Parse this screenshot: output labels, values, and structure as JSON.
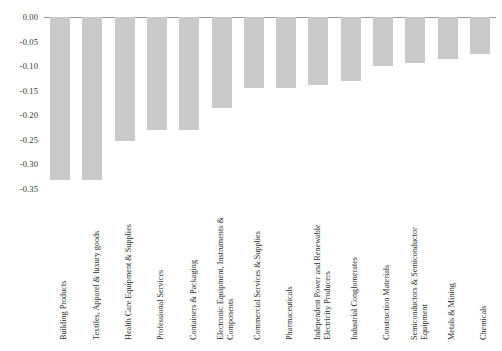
{
  "chart_data": {
    "type": "bar",
    "title": "",
    "subtitle": "",
    "xlabel": "",
    "ylabel": "",
    "ylim": [
      -0.35,
      0.0
    ],
    "grid": false,
    "legend": null,
    "bar_color": "#c9c9c9",
    "axis_color": "#9a9a9a",
    "y_ticks": [
      "0.00",
      "-0.05",
      "-0.10",
      "-0.15",
      "-0.20",
      "-0.25",
      "-0.30",
      "-0.35"
    ],
    "y_tick_values": [
      0.0,
      -0.05,
      -0.1,
      -0.15,
      -0.2,
      -0.25,
      -0.3,
      -0.35
    ],
    "categories": [
      "Building Products",
      "Textiles, Apparel & luxury goods",
      "Health Care Equipment & Supplies",
      "Professional Services",
      "Containers & Packaging",
      "Electronic Equipment, Instruments & Components",
      "Commercial Services & Supplies",
      "Pharmaceuticals",
      "Independent Power and Renewable Electricity Producers",
      "Industrial Conglomerates",
      "Construction Materials",
      "Semiconductors & Semiconductor Equipment",
      "Metals & Mining",
      "Chemicals"
    ],
    "category_lines": [
      [
        "Building Products"
      ],
      [
        "Textiles, Apparel & luxury goods"
      ],
      [
        "Health Care Equipment & Supplies"
      ],
      [
        "Professional Services"
      ],
      [
        "Containers & Packaging"
      ],
      [
        "Electronic Equipment, Instruments &",
        "Components"
      ],
      [
        "Commercial Services & Supplies"
      ],
      [
        "Pharmaceuticals"
      ],
      [
        "Independent Power and Renewable",
        "Electricity Producers"
      ],
      [
        "Industrial Conglomerates"
      ],
      [
        "Construction Materials"
      ],
      [
        "Semiconductors & Semiconductor",
        "Equipment"
      ],
      [
        "Metals & Mining"
      ],
      [
        "Chemicals"
      ]
    ],
    "values": [
      -0.332,
      -0.332,
      -0.252,
      -0.229,
      -0.229,
      -0.185,
      -0.145,
      -0.145,
      -0.138,
      -0.131,
      -0.1,
      -0.093,
      -0.086,
      -0.076
    ]
  }
}
